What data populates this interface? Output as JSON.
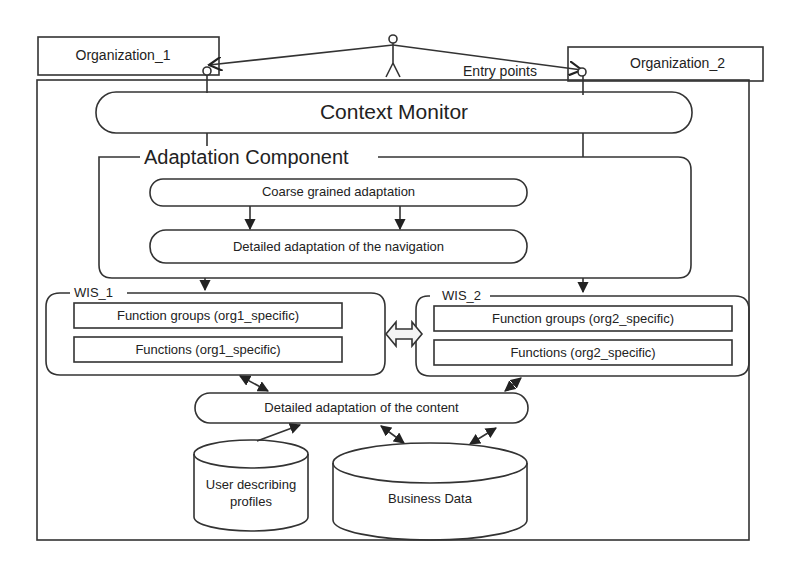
{
  "diagram": {
    "actor": {
      "label": "Entry points"
    },
    "organizations": [
      {
        "id": "org1",
        "label": "Organization_1"
      },
      {
        "id": "org2",
        "label": "Organization_2"
      }
    ],
    "context_monitor": {
      "label": "Context Monitor"
    },
    "adaptation_component": {
      "title": "Adaptation Component",
      "steps": [
        {
          "label": "Coarse grained adaptation"
        },
        {
          "label": "Detailed adaptation of the navigation"
        }
      ]
    },
    "wis": [
      {
        "title": "WIS_1",
        "rows": [
          "Function groups (org1_specific)",
          "Functions (org1_specific)"
        ]
      },
      {
        "title": "WIS_2",
        "rows": [
          "Function groups (org2_specific)",
          "Functions (org2_specific)"
        ]
      }
    ],
    "content_adaptation": {
      "label": "Detailed adaptation of the content"
    },
    "databases": [
      {
        "label_line1": "User describing",
        "label_line2": "profiles"
      },
      {
        "label_line1": "Business Data"
      }
    ]
  }
}
